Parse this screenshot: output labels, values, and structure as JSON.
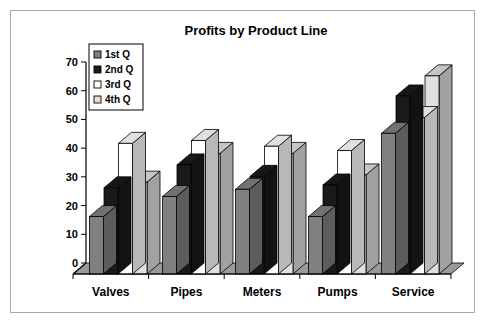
{
  "chart_data": {
    "type": "bar",
    "title": "Profits by Product Line",
    "xlabel": "",
    "ylabel": "",
    "ylim": [
      0,
      70
    ],
    "ytick_step": 10,
    "yticks": [
      "0",
      "10",
      "20",
      "30",
      "40",
      "50",
      "60",
      "70"
    ],
    "grid": false,
    "legend_position": "top-left",
    "style": "3d-clustered-column",
    "categories": [
      "Valves",
      "Pipes",
      "Meters",
      "Pumps",
      "Service"
    ],
    "series": [
      {
        "name": "1st Q",
        "color": "#808080",
        "values": [
          20,
          27,
          29.5,
          20,
          49
        ]
      },
      {
        "name": "2nd Q",
        "color": "#1a1a1a",
        "values": [
          30,
          38,
          34,
          31,
          62
        ]
      },
      {
        "name": "3rd Q",
        "color": "#ffffff",
        "values": [
          45.5,
          46.5,
          44.5,
          43,
          54.5
        ]
      },
      {
        "name": "4th Q",
        "color": "#e0e0e0",
        "values": [
          32,
          42,
          42,
          34.5,
          69
        ]
      }
    ]
  },
  "legend": {
    "items": [
      {
        "label": "1st Q",
        "swatch": "#808080"
      },
      {
        "label": "2nd Q",
        "swatch": "#1a1a1a"
      },
      {
        "label": "3rd Q",
        "swatch": "#ffffff"
      },
      {
        "label": "4th Q",
        "swatch": "#e0e0e0"
      }
    ]
  },
  "colors": {
    "frame_border": "#a9a9a9",
    "background": "#ffffff",
    "axis": "#000000",
    "floor": "#9a9a9a",
    "text": "#000000"
  }
}
